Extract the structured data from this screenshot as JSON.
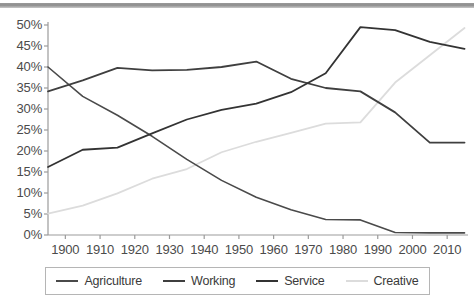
{
  "chart_data": {
    "type": "line",
    "title": "",
    "subtitle": "",
    "xlabel": "",
    "ylabel": "",
    "xlim": [
      1895,
      2016
    ],
    "ylim": [
      0,
      50
    ],
    "grid": false,
    "legend_position": "bottom",
    "x": [
      1895,
      1905,
      1915,
      1925,
      1935,
      1945,
      1955,
      1965,
      1975,
      1985,
      1995,
      2005,
      2015
    ],
    "xticks": [
      "1900",
      "1910",
      "1920",
      "1930",
      "1940",
      "1950",
      "1960",
      "1970",
      "1980",
      "1990",
      "2000",
      "2010"
    ],
    "xtick_values": [
      1900,
      1910,
      1920,
      1930,
      1940,
      1950,
      1960,
      1970,
      1980,
      1990,
      2000,
      2010
    ],
    "yticks": [
      "0%",
      "5%",
      "10%",
      "15%",
      "20%",
      "25%",
      "30%",
      "35%",
      "40%",
      "45%",
      "50%"
    ],
    "ytick_values": [
      0,
      5,
      10,
      15,
      20,
      25,
      30,
      35,
      40,
      45,
      50
    ],
    "series": [
      {
        "name": "Agriculture",
        "color": "#4a4a4a",
        "width": 1.6,
        "values": [
          40.0,
          33.0,
          28.5,
          23.5,
          18.0,
          13.0,
          9.0,
          6.0,
          3.7,
          3.6,
          0.6,
          0.5,
          0.5
        ]
      },
      {
        "name": "Working",
        "color": "#3f3f3f",
        "width": 1.8,
        "values": [
          34.2,
          36.8,
          39.8,
          39.2,
          39.3,
          40.0,
          41.3,
          37.2,
          35.0,
          34.2,
          29.2,
          22.0,
          22.0
        ]
      },
      {
        "name": "Service",
        "color": "#333333",
        "width": 1.8,
        "values": [
          16.2,
          20.3,
          20.8,
          24.2,
          27.5,
          29.8,
          31.3,
          34.0,
          38.5,
          49.5,
          48.8,
          46.0,
          44.3
        ]
      },
      {
        "name": "Creative",
        "color": "#dcdcdc",
        "width": 1.8,
        "values": [
          5.1,
          7.0,
          9.9,
          13.4,
          15.7,
          19.7,
          22.2,
          24.3,
          26.5,
          26.8,
          36.3,
          42.8,
          49.3
        ]
      }
    ]
  },
  "legend": {
    "items": [
      {
        "label": "Agriculture",
        "color": "#4a4a4a"
      },
      {
        "label": "Working",
        "color": "#3f3f3f"
      },
      {
        "label": "Service",
        "color": "#333333"
      },
      {
        "label": "Creative",
        "color": "#dcdcdc"
      }
    ]
  }
}
